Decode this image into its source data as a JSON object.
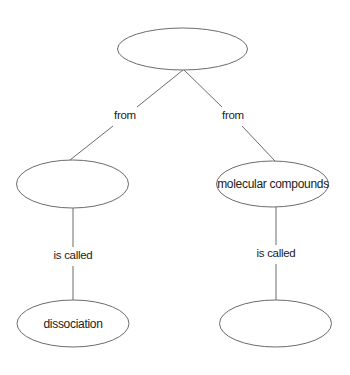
{
  "diagram": {
    "type": "concept-map",
    "nodes": [
      {
        "id": "root",
        "text": ""
      },
      {
        "id": "left-mid",
        "text": ""
      },
      {
        "id": "right-mid",
        "text": "molecular compounds"
      },
      {
        "id": "left-bottom",
        "text": "dissociation"
      },
      {
        "id": "right-bottom",
        "text": ""
      }
    ],
    "links": [
      {
        "from": "root",
        "to": "left-mid",
        "label": "from"
      },
      {
        "from": "root",
        "to": "right-mid",
        "label": "from"
      },
      {
        "from": "left-mid",
        "to": "left-bottom",
        "label": "is called"
      },
      {
        "from": "right-mid",
        "to": "right-bottom",
        "label": "is called"
      }
    ]
  },
  "colors": {
    "stroke": "#6b6b6b",
    "text": "#222222",
    "background": "#ffffff"
  }
}
